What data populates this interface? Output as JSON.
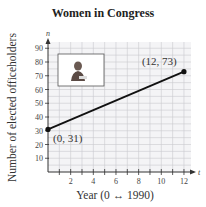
{
  "chart_data": {
    "type": "line",
    "title": "Women in Congress",
    "xlabel": "Year (0 ↔ 1990)",
    "ylabel": "Number of elected officeholders",
    "x_axis_var": "t",
    "y_axis_var": "n",
    "x": [
      0,
      12
    ],
    "series": [
      {
        "name": "Women in Congress",
        "values": [
          31,
          73
        ]
      }
    ],
    "points": [
      {
        "x": 0,
        "y": 31,
        "label": "(0, 31)"
      },
      {
        "x": 12,
        "y": 73,
        "label": "(12, 73)"
      }
    ],
    "xticks": [
      2,
      4,
      6,
      8,
      10,
      12
    ],
    "yticks": [
      10,
      20,
      30,
      40,
      50,
      60,
      70,
      80,
      90
    ],
    "xlim": [
      0,
      12.8
    ],
    "ylim": [
      0,
      95
    ],
    "grid": true,
    "legend": null,
    "annotations": [
      "(0, 31)",
      "(12, 73)"
    ],
    "inset_image": "woman-at-podium-photo"
  }
}
